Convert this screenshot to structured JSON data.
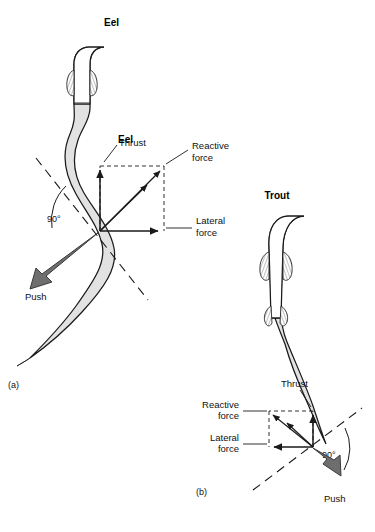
{
  "figure": {
    "background": "#ffffff",
    "body_fill": "#e0e0e0",
    "body_stroke": "#1a1a1a",
    "push_fill": "#6e6e6e",
    "arrow_color": "#1a1a1a",
    "dashed_color": "#1a1a1a"
  },
  "panels": [
    {
      "id": "a",
      "panel_label": "(a)",
      "title": "Eel",
      "angle_label": "90°",
      "labels": {
        "thrust": "Thrust",
        "reactive_force_line1": "Reactive",
        "reactive_force_line2": "force",
        "lateral_force_line1": "Lateral",
        "lateral_force_line2": "force",
        "push": "Push"
      }
    },
    {
      "id": "b",
      "panel_label": "(b)",
      "title": "Trout",
      "angle_label": "90°",
      "labels": {
        "thrust": "Thrust",
        "reactive_force_line1": "Reactive",
        "reactive_force_line2": "force",
        "lateral_force_line1": "Lateral",
        "lateral_force_line2": "force",
        "push": "Push"
      }
    }
  ]
}
